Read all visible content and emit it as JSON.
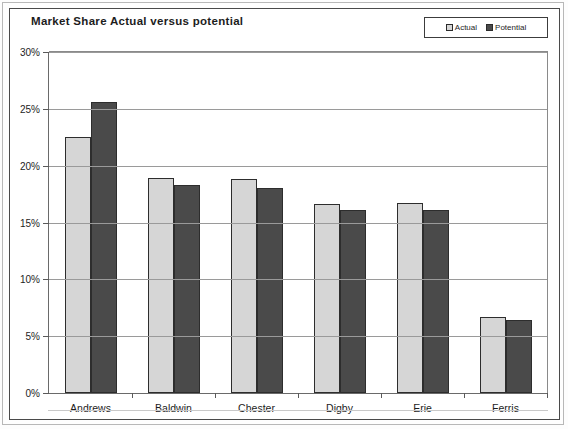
{
  "chart_data": {
    "type": "bar",
    "title": "Market Share Actual versus potential",
    "xlabel": "",
    "ylabel": "",
    "categories": [
      "Andrews",
      "Baldwin",
      "Chester",
      "Digby",
      "Erie",
      "Ferris"
    ],
    "series": [
      {
        "name": "Actual",
        "values": [
          22.5,
          18.9,
          18.8,
          16.6,
          16.7,
          6.7
        ]
      },
      {
        "name": "Potential",
        "values": [
          25.6,
          18.3,
          18.0,
          16.1,
          16.1,
          6.4
        ]
      }
    ],
    "ylim": [
      0,
      30
    ],
    "yticks": [
      0,
      5,
      10,
      15,
      20,
      25,
      30
    ],
    "ytick_labels": [
      "0%",
      "5%",
      "10%",
      "15%",
      "20%",
      "25%",
      "30%"
    ],
    "grid": true,
    "legend_position": "top-right",
    "colors": {
      "actual": "#d6d6d6",
      "potential": "#4a4a4a",
      "border": "#2d2d2d",
      "gridline": "#9a9a9a",
      "axis": "#6a6a6a",
      "text": "#1d1d1d",
      "background": "#ffffff"
    }
  },
  "legend": {
    "items": [
      {
        "label": "Actual"
      },
      {
        "label": "Potential"
      }
    ]
  }
}
